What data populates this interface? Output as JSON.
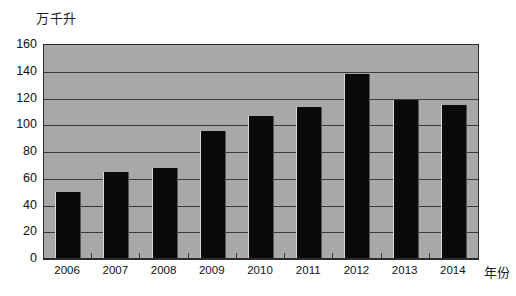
{
  "chart_data": {
    "type": "bar",
    "title": "",
    "subtitle": "",
    "xlabel": "年份",
    "ylabel": "万千升",
    "categories": [
      "2006",
      "2007",
      "2008",
      "2009",
      "2010",
      "2011",
      "2012",
      "2013",
      "2014"
    ],
    "values": [
      50,
      65,
      68,
      96,
      107,
      114,
      138,
      119,
      115
    ],
    "series": [
      {
        "name": "产量",
        "values": [
          50,
          65,
          68,
          96,
          107,
          114,
          138,
          119,
          115
        ]
      }
    ],
    "ylim": [
      0,
      160
    ],
    "ytick_labels": [
      "0",
      "20",
      "40",
      "60",
      "80",
      "100",
      "120",
      "140",
      "160"
    ],
    "ytick_values": [
      0,
      20,
      40,
      60,
      80,
      100,
      120,
      140,
      160
    ],
    "grid": true,
    "grid_axis": "y",
    "legend": false,
    "legend_position": "none",
    "annotations": [],
    "colors": {
      "bar": "#0a0a0a",
      "plot_background": "#a8a8a8",
      "gridline": "#3a3a3a",
      "axis": "#2b2b2b",
      "page_background": "#ffffff",
      "text": "#111111"
    }
  }
}
